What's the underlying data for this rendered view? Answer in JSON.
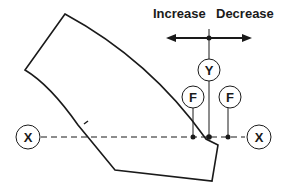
{
  "labels": {
    "increase": "Increase",
    "decrease": "Decrease"
  },
  "nodes": {
    "x_left": "X",
    "x_right": "X",
    "y": "Y",
    "f_left": "F",
    "f_right": "F"
  },
  "colors": {
    "stroke": "#1a1a1a",
    "background": "#ffffff"
  }
}
